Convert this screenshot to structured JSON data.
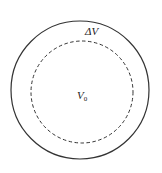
{
  "diagram": {
    "outer_circle": {
      "cx": 80,
      "cy": 90,
      "r": 69,
      "style": "solid"
    },
    "inner_circle": {
      "cx": 82,
      "cy": 92,
      "r": 51,
      "style": "dashed"
    },
    "labels": {
      "delta_v": "ΔV",
      "v0_main": "V",
      "v0_sub": "0"
    },
    "colors": {
      "stroke": "#333333"
    }
  }
}
